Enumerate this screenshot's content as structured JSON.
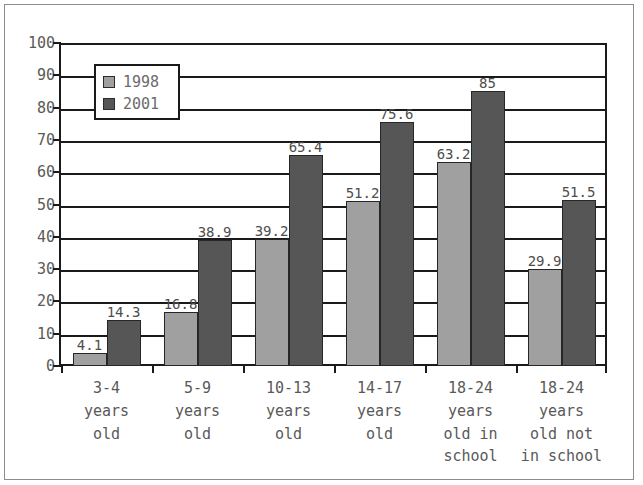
{
  "chart_data": {
    "type": "bar",
    "title": "",
    "subtitle": "",
    "xlabel": "",
    "ylabel": "",
    "ylim": [
      0,
      100
    ],
    "ytick_step": 10,
    "yticks": [
      "0",
      "10",
      "20",
      "30",
      "40",
      "50",
      "60",
      "70",
      "80",
      "90",
      "100"
    ],
    "grid": true,
    "legend_position": "upper-left-inside",
    "categories": [
      "3-4\nyears\nold",
      "5-9\nyears\nold",
      "10-13\nyears\nold",
      "14-17\nyears\nold",
      "18-24\nyears\nold in\nschool",
      "18-24\nyears\nold not\nin school"
    ],
    "series": [
      {
        "name": "1998",
        "color": "#a0a0a0",
        "values": [
          4.1,
          16.8,
          39.2,
          51.2,
          63.2,
          29.9
        ],
        "labels": [
          "4.1",
          "16.8",
          "39.2",
          "51.2",
          "63.2",
          "29.9"
        ]
      },
      {
        "name": "2001",
        "color": "#565656",
        "values": [
          14.3,
          38.9,
          65.4,
          75.6,
          85,
          51.5
        ],
        "labels": [
          "14.3",
          "38.9",
          "65.4",
          "75.6",
          "85",
          "51.5"
        ]
      }
    ]
  },
  "legend": {
    "entries": [
      {
        "label": "1998",
        "swatch": "legend-swatch-1998"
      },
      {
        "label": "2001",
        "swatch": "legend-swatch-2001"
      }
    ]
  },
  "colors": {
    "series_1998": "#a0a0a0",
    "series_2001": "#565656",
    "axis": "#1a1a1a",
    "text": "#595959",
    "frame": "#8c8c8c",
    "background": "#ffffff"
  }
}
